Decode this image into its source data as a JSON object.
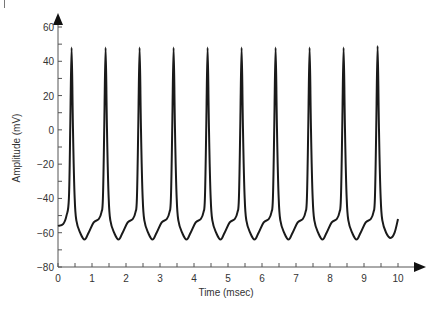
{
  "chart_data": {
    "type": "line",
    "title": "",
    "xlabel": "Time (msec)",
    "ylabel": "Amplitude (mV)",
    "xlim": [
      0,
      10
    ],
    "ylim": [
      -80,
      60
    ],
    "x_ticks": [
      0,
      1,
      2,
      3,
      4,
      5,
      6,
      7,
      8,
      9,
      10
    ],
    "y_ticks": [
      -80,
      -60,
      -40,
      -20,
      0,
      20,
      40,
      60
    ],
    "grid": false,
    "legend": null,
    "line_color": "#1a1a1a",
    "series": [
      {
        "name": "Membrane potential",
        "description": "Periodic action-potential spikes, ~1 ms period, 9 spikes",
        "spike_times": [
          0.4,
          1.4,
          2.4,
          3.4,
          4.4,
          5.4,
          6.4,
          7.4,
          8.4,
          9.4
        ],
        "peak_mV": [
          48,
          48,
          48,
          48,
          48,
          48,
          48,
          48,
          48,
          49
        ],
        "trough_mV": -64,
        "resting_start_mV": -56,
        "plateau_mV": -52,
        "end": {
          "x": 10.0,
          "y": -52
        }
      }
    ]
  }
}
